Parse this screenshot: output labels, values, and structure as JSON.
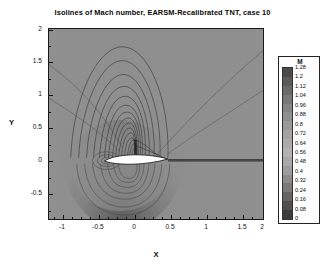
{
  "figure": {
    "title": "Isolines of Mach number,  EARSM-Recalibrated TNT, case 10",
    "background": "#ffffff",
    "plot_background": "#8f8f8f",
    "frame_color": "#1a1a1a"
  },
  "axes": {
    "x_label": "X",
    "y_label": "Y",
    "x_ticks": [
      "-1",
      "-0.5",
      "0",
      "0.5",
      "1",
      "1.5",
      "2"
    ],
    "y_ticks": [
      "2",
      "1.5",
      "1",
      "0.5",
      "0",
      "-0.5"
    ]
  },
  "legend": {
    "title": "M",
    "labels": [
      "1.28",
      "1.2",
      "1.12",
      "1.04",
      "0.96",
      "0.88",
      "0.8",
      "0.72",
      "0.64",
      "0.56",
      "0.48",
      "0.4",
      "0.32",
      "0.24",
      "0.16",
      "0.08",
      "0"
    ],
    "colors": [
      "#4a4a4a",
      "#5a5a5a",
      "#6a6a6a",
      "#787878",
      "#858585",
      "#909090",
      "#9a9a9a",
      "#a3a3a3",
      "#ababab",
      "#b2b2b2",
      "#a8a8a8",
      "#9c9c9c",
      "#8c8c8c",
      "#7a7a7a",
      "#656565",
      "#505050",
      "#3c3c3c"
    ]
  },
  "chart_data": {
    "type": "contour",
    "title": "Isolines of Mach number,  EARSM-Recalibrated TNT, case 10",
    "xlabel": "X",
    "ylabel": "Y",
    "xlim": [
      -1.2,
      2.15
    ],
    "ylim": [
      -0.8,
      2.05
    ],
    "variable": "M",
    "contour_levels": [
      0,
      0.08,
      0.16,
      0.24,
      0.32,
      0.4,
      0.48,
      0.56,
      0.64,
      0.72,
      0.8,
      0.88,
      0.96,
      1.04,
      1.12,
      1.2,
      1.28
    ],
    "level_step": 0.08,
    "vmin": 0,
    "vmax": 1.28,
    "colormap": "grayscale",
    "grid": false,
    "legend_position": "right-outside",
    "features": [
      {
        "name": "airfoil",
        "type": "body",
        "chord_x": [
          0.0,
          1.0
        ],
        "y": 0.0,
        "fill": "#ffffff"
      },
      {
        "name": "supersonic-pocket",
        "type": "region",
        "location": "upper-surface",
        "x_range": [
          0.05,
          0.62
        ]
      },
      {
        "name": "shock",
        "type": "discontinuity",
        "x": 0.62,
        "y_range": [
          0.0,
          0.34
        ]
      },
      {
        "name": "wake",
        "type": "line",
        "x_range": [
          1.0,
          2.15
        ],
        "y": 0.0
      },
      {
        "name": "mach-wave-upper-left",
        "type": "line"
      },
      {
        "name": "mach-wave-upper-right",
        "type": "line"
      }
    ]
  }
}
